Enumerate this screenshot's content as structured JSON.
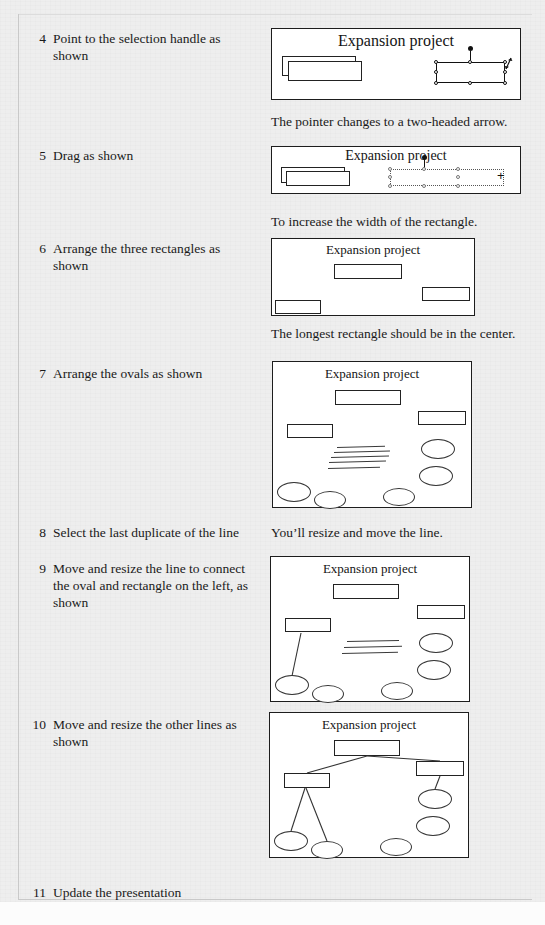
{
  "document": {
    "running_header": "",
    "slide_title": "Expansion project"
  },
  "steps": [
    {
      "number": "4",
      "text": "Point to the selection handle as shown",
      "caption": "The pointer changes to a two-headed arrow."
    },
    {
      "number": "5",
      "text": "Drag as shown",
      "caption": "To increase the width of the rectangle."
    },
    {
      "number": "6",
      "text": "Arrange the three rectangles as shown",
      "caption": "The longest rectangle should be in the center."
    },
    {
      "number": "7",
      "text": "Arrange the ovals as shown",
      "caption": ""
    },
    {
      "number": "8",
      "text": "Select the last duplicate of the line",
      "caption": "You’ll resize and move the line."
    },
    {
      "number": "9",
      "text": "Move and resize the line to connect the oval and rectangle on the left, as shown",
      "caption": ""
    },
    {
      "number": "10",
      "text": "Move and resize the other lines as shown",
      "caption": ""
    },
    {
      "number": "11",
      "text": "Update the presentation",
      "caption": ""
    }
  ],
  "colors": {
    "page_background": "#eeeeee",
    "slide_background": "#ffffff",
    "ink": "#1a1a1a",
    "slide_border": "#1d1d1d"
  }
}
